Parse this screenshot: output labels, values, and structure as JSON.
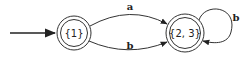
{
  "diagram": {
    "type": "finite-automaton",
    "states": [
      {
        "id": "s1",
        "label": "{1}",
        "accepting": true,
        "initial": true
      },
      {
        "id": "s2",
        "label": "{2, 3}",
        "accepting": true,
        "initial": false
      }
    ],
    "transitions": [
      {
        "from": "s1",
        "to": "s2",
        "label": "a"
      },
      {
        "from": "s1",
        "to": "s2",
        "label": "b"
      },
      {
        "from": "s2",
        "to": "s2",
        "label": "b"
      }
    ]
  }
}
